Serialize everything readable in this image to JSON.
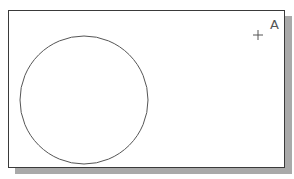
{
  "diagram": {
    "type": "cad-drawing-viewport",
    "point_label": "A",
    "point_marker": "crosshair-plus",
    "shapes": [
      {
        "kind": "circle",
        "cx": 84,
        "cy": 100,
        "r": 64,
        "stroke": "#555555"
      }
    ],
    "colors": {
      "background": "#ffffff",
      "border": "#3a3a3a",
      "shadow": "#a9a9a9",
      "stroke": "#555555"
    }
  }
}
